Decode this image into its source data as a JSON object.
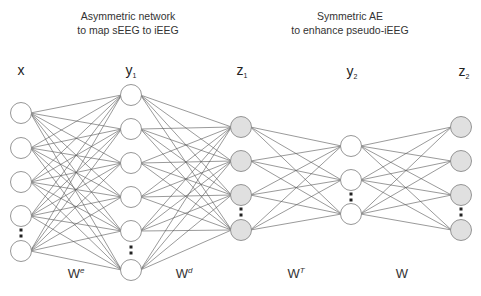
{
  "titles": {
    "asymmetric": {
      "line1": "Asymmetric network",
      "line2": "to map sEEG to iEEG"
    },
    "symmetric": {
      "line1": "Symmetric AE",
      "line2": "to enhance pseudo-iEEG"
    }
  },
  "layers": [
    {
      "id": "x",
      "label": "x",
      "subscript": "",
      "visible_nodes": 5,
      "ellipsis_before_last": true,
      "style": "plain"
    },
    {
      "id": "y1",
      "label": "y",
      "subscript": "1",
      "visible_nodes": 6,
      "ellipsis_before_last": true,
      "style": "plain"
    },
    {
      "id": "z1",
      "label": "z",
      "subscript": "1",
      "visible_nodes": 4,
      "ellipsis_before_last": true,
      "style": "shaded"
    },
    {
      "id": "y2",
      "label": "y",
      "subscript": "2",
      "visible_nodes": 3,
      "ellipsis_before_last": true,
      "style": "plain"
    },
    {
      "id": "z2",
      "label": "z",
      "subscript": "2",
      "visible_nodes": 4,
      "ellipsis_before_last": true,
      "style": "shaded"
    }
  ],
  "connections": [
    {
      "from": "x",
      "to": "y1",
      "type": "fully-connected"
    },
    {
      "from": "y1",
      "to": "z1",
      "type": "fully-connected"
    },
    {
      "from": "z1",
      "to": "y2",
      "type": "fully-connected"
    },
    {
      "from": "y2",
      "to": "z2",
      "type": "fully-connected"
    }
  ],
  "weights": [
    {
      "base": "W",
      "superscript": "e"
    },
    {
      "base": "W",
      "superscript": "d"
    },
    {
      "base": "W",
      "superscript": "T"
    },
    {
      "base": "W",
      "superscript": ""
    }
  ],
  "colors": {
    "node_plain_fill": "#ffffff",
    "node_shaded_fill": "#e0e0e0",
    "node_stroke": "#8a8a8a",
    "edge": "#555555"
  }
}
